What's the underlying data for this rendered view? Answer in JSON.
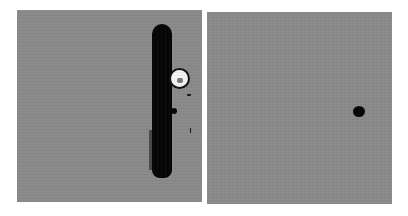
{
  "figure": {
    "panels": [
      {
        "id": "left",
        "description": "grayscale image with vertical dark bar, bright circular particle, and small dark dot",
        "background_color": "#8a8a8a",
        "features": [
          "vertical-dark-bar",
          "bright-circle",
          "small-dark-dot",
          "speck"
        ]
      },
      {
        "id": "right",
        "description": "grayscale image with single small dark dot",
        "background_color": "#8a8a8a",
        "features": [
          "small-dark-dot"
        ]
      }
    ]
  }
}
